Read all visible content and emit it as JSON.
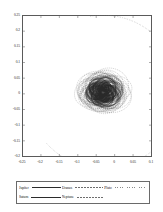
{
  "figure": {
    "background": "#ffffff",
    "frame_color": "#5a5a5a"
  },
  "chart_data": {
    "type": "scatter",
    "title": "",
    "subtitle": "",
    "xlabel": "",
    "ylabel": "",
    "grid": false,
    "xlim": [
      -0.25,
      0.1
    ],
    "ylim": [
      -0.2,
      0.25
    ],
    "xticks": [
      "-0.25",
      "-0.2",
      "-0.15",
      "-0.1",
      "-0.05",
      "0",
      "0.05",
      "0.1"
    ],
    "xtick_values": [
      -0.25,
      -0.2,
      -0.15,
      -0.1,
      -0.05,
      0,
      0.05,
      0.1
    ],
    "yticks": [
      "0.25",
      "0.2",
      "0.15",
      "0.1",
      "0.05",
      "0",
      "-0.05",
      "-0.1",
      "-0.15",
      "-0.2"
    ],
    "ytick_values": [
      0.25,
      0.2,
      0.15,
      0.1,
      0.05,
      0,
      -0.05,
      -0.1,
      -0.15,
      -0.2
    ],
    "legend_position": "bottom",
    "series": [
      {
        "name": "Jupiter",
        "style": "solid",
        "color": "#2b2b2b",
        "description": "dense overlapping near-circular loops centered on origin cluster",
        "center": [
          -0.032,
          0.005
        ],
        "radius": 0.028,
        "loops": 60
      },
      {
        "name": "Saturn",
        "style": "solid",
        "color": "#2b2b2b",
        "description": "dense overlapping loops, slightly larger than Jupiter",
        "center": [
          -0.032,
          0.005
        ],
        "radius": 0.04,
        "loops": 48
      },
      {
        "name": "Uranus",
        "style": "dashed",
        "color": "#6d6d6d",
        "description": "dense overlapping loops forming outer band of cluster",
        "center": [
          -0.032,
          0.005
        ],
        "radius": 0.05,
        "loops": 34
      },
      {
        "name": "Neptune",
        "style": "dashed",
        "color": "#6d6d6d",
        "description": "outermost loops of the cluster",
        "center": [
          -0.032,
          0.005
        ],
        "radius": 0.058,
        "loops": 26
      },
      {
        "name": "Pluto",
        "style": "dotted",
        "color": "#8a8a8a",
        "description": "large dotted open arc sweeping from upper right to lower left on the left half of the plot",
        "arc_start": [
          -0.063,
          0.223
        ],
        "arc_end": [
          -0.186,
          -0.157
        ],
        "arc_extreme_x": -0.238
      }
    ]
  },
  "legend": {
    "entries": [
      {
        "label": "Jupiter",
        "style": "solid"
      },
      {
        "label": "Uranus",
        "style": "dashed"
      },
      {
        "label": "Pluto",
        "style": "dotted"
      },
      {
        "label": "Saturn",
        "style": "solid"
      },
      {
        "label": "Neptune",
        "style": "dashed"
      }
    ]
  }
}
